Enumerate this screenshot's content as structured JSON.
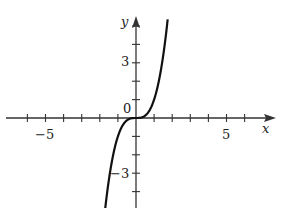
{
  "chart_data": {
    "type": "line",
    "title": "",
    "function": "y = x^3",
    "xlabel": "x",
    "ylabel": "y",
    "x_tick_labels": [
      {
        "value": -5,
        "label": "−5"
      },
      {
        "value": 5,
        "label": "5"
      }
    ],
    "y_tick_labels": [
      {
        "value": 3,
        "label": "3"
      },
      {
        "value": -3,
        "label": "−3"
      }
    ],
    "origin_label": "0",
    "x_ticks": [
      -6,
      -5,
      -4,
      -3,
      -2,
      -1,
      1,
      2,
      3,
      4,
      5,
      6
    ],
    "y_ticks": [
      -5,
      -4,
      -3,
      -2,
      -1,
      1,
      2,
      3,
      4,
      5
    ],
    "xlim": [
      -7,
      7.4
    ],
    "ylim": [
      -4.9,
      5.4
    ],
    "grid": false,
    "series": [
      {
        "name": "f(x)",
        "x": [
          -1.7,
          -1.5,
          -1.25,
          -1,
          -0.75,
          -0.5,
          -0.25,
          0,
          0.25,
          0.5,
          0.75,
          1,
          1.25,
          1.5,
          1.75
        ],
        "values": [
          -4.91,
          -3.38,
          -1.95,
          -1,
          -0.42,
          -0.13,
          -0.02,
          0,
          0.02,
          0.13,
          0.42,
          1,
          1.95,
          3.38,
          5.36
        ]
      }
    ],
    "colors": {
      "axis": "#333333",
      "curve": "#111111"
    }
  },
  "labels": {
    "x_axis": "x",
    "y_axis": "y",
    "origin": "0",
    "x_neg5": "−5",
    "x_pos5": "5",
    "y_pos3": "3",
    "y_neg3": "−3"
  }
}
